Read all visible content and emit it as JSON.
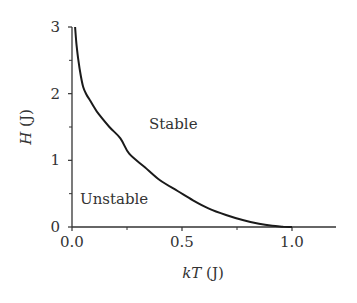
{
  "chart_data": {
    "type": "line",
    "title": "",
    "xlabel": "kT (J)",
    "ylabel": "H (J)",
    "xlabel_parts": {
      "italic": "kT",
      "unit": " (J)"
    },
    "ylabel_parts": {
      "italic": "H",
      "unit": " (J)"
    },
    "xlim": [
      0,
      1.2
    ],
    "ylim": [
      0,
      3
    ],
    "grid": false,
    "legend": null,
    "x_ticks": [
      0.0,
      0.5,
      1.0
    ],
    "x_tick_labels": [
      "0.0",
      "0.5",
      "1.0"
    ],
    "x_minor_ticks": [
      0.25,
      0.75
    ],
    "y_ticks": [
      0,
      1,
      2,
      3
    ],
    "y_tick_labels": [
      "0",
      "1",
      "2",
      "3"
    ],
    "y_minor_ticks": [
      0.5,
      1.5,
      2.5
    ],
    "series": [
      {
        "name": "stability boundary",
        "color": "#1a1a1a",
        "x": [
          0.014,
          0.02,
          0.029,
          0.04,
          0.051,
          0.065,
          0.082,
          0.1,
          0.12,
          0.17,
          0.22,
          0.26,
          0.33,
          0.4,
          0.48,
          0.55,
          0.62,
          0.7,
          0.78,
          0.85,
          0.91,
          0.96,
          1.0
        ],
        "y": [
          3.0,
          2.75,
          2.5,
          2.27,
          2.1,
          1.99,
          1.9,
          1.8,
          1.7,
          1.5,
          1.33,
          1.1,
          0.9,
          0.7,
          0.54,
          0.4,
          0.28,
          0.18,
          0.1,
          0.05,
          0.02,
          0.005,
          0.0
        ]
      }
    ],
    "annotations": [
      {
        "text": "Stable",
        "x": 0.5,
        "y": 1.55
      },
      {
        "text": "Unstable",
        "x": 0.2,
        "y": 0.45
      }
    ]
  },
  "labels": {
    "stable": "Stable",
    "unstable": "Unstable",
    "x_axis_italic": "kT",
    "x_axis_unit": " (J)",
    "y_axis_italic": "H",
    "y_axis_unit": " (J)"
  },
  "colors": {
    "curve": "#1a1a1a",
    "axis": "#333333",
    "text": "#333333"
  }
}
